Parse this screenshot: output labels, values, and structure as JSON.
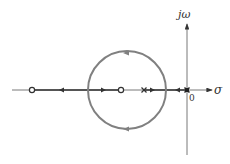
{
  "diagram": {
    "type": "root-locus",
    "axes": {
      "real_label": "σ",
      "imag_label": "jω",
      "origin_label": "0"
    },
    "colors": {
      "axis": "#333333",
      "locus_circle": "#808080",
      "locus_real": "#333333",
      "background": "#ffffff"
    },
    "zeros": [
      {
        "label": "zero-1",
        "marker": "o"
      },
      {
        "label": "zero-2",
        "marker": "o"
      }
    ],
    "poles": [
      {
        "label": "pole-1",
        "marker": "x"
      },
      {
        "label": "pole-2",
        "marker": "x (at origin)"
      }
    ],
    "locus_branches": [
      {
        "name": "circle-arc-upper",
        "direction": "counterclockwise toward left"
      },
      {
        "name": "circle-arc-lower",
        "direction": "clockwise toward left"
      }
    ]
  }
}
